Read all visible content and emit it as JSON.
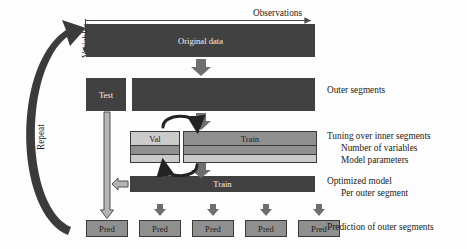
{
  "diagram": {
    "axes": {
      "observations_label": "Observations",
      "variables_label": "Variables"
    },
    "repeat_label": "Repeat",
    "blocks": {
      "original_data": "Original data",
      "test": "Test",
      "val": "Val",
      "train_inner": "Train",
      "train_optimized": "Train"
    },
    "pred_boxes": [
      {
        "label": "Pred"
      },
      {
        "label": "Pred"
      },
      {
        "label": "Pred"
      },
      {
        "label": "Pred"
      },
      {
        "label": "Pred"
      }
    ],
    "right_labels": {
      "outer_segments": "Outer segments",
      "tuning_line1": "Tuning over inner segments",
      "tuning_line2": "Number of variables",
      "tuning_line3": "Model parameters",
      "optimized_line1": "Optimized model",
      "optimized_line2": "Per outer segment",
      "prediction": "Prediction of outer segments"
    },
    "colors": {
      "dark": "#414141",
      "mid": "#8f8f8f",
      "light": "#cbcbcb",
      "outline": "#3a3a3a",
      "text_on_dark": "#f2f2f2",
      "text_dark": "#1a1a1a",
      "background": "#fdfdfd"
    }
  }
}
